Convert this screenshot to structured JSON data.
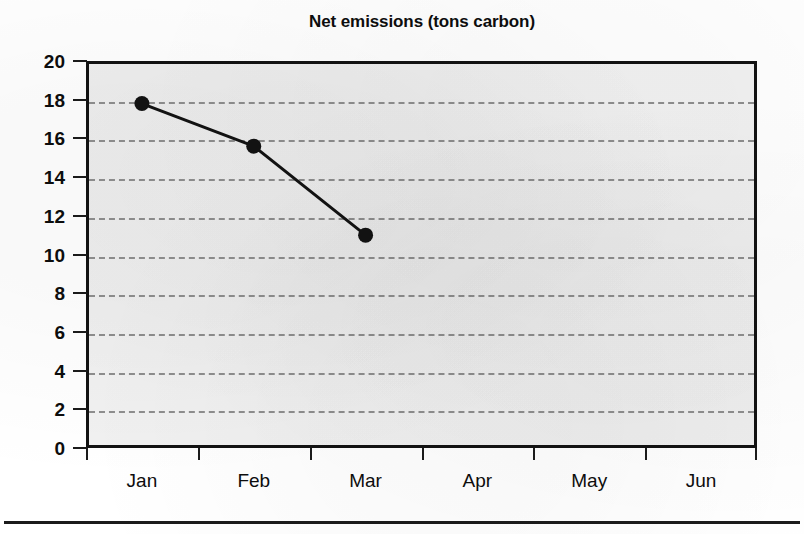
{
  "chart_data": {
    "type": "line",
    "title": "Net emissions (tons carbon)",
    "xlabel": "",
    "ylabel": "",
    "categories": [
      "Jan",
      "Feb",
      "Mar",
      "Apr",
      "May",
      "Jun"
    ],
    "series": [
      {
        "name": "Net emissions",
        "values": [
          17.8,
          15.6,
          11.0,
          null,
          null,
          null
        ]
      }
    ],
    "ylim": [
      0,
      20
    ],
    "y_ticks": [
      0,
      2,
      4,
      6,
      8,
      10,
      12,
      14,
      16,
      18,
      20
    ],
    "y_tick_labels": [
      "0",
      "2",
      "4",
      "6",
      "8",
      "10",
      "12",
      "14",
      "16",
      "18",
      "20"
    ],
    "grid": true,
    "grid_style": "dashed-horizontal",
    "legend": "none",
    "marker": "filled-circle",
    "line_color": "#121212",
    "marker_color": "#121212",
    "plot_background": "#f1f1f1",
    "axis_color": "#121212",
    "gridline_color": "#8e8e8e"
  },
  "figure": {
    "background": "#ffffff",
    "has_bottom_rule": true
  }
}
